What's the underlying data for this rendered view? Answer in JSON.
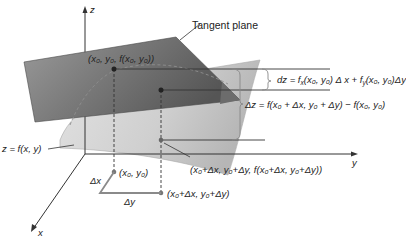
{
  "figure": {
    "colors": {
      "tangent_plane_dark": "#5e5e5e",
      "tangent_plane_light": "#9a9a9a",
      "surface_light": "#d4d4d4",
      "surface_mid": "#bdbdbd",
      "axis": "#333333",
      "point": "#444444",
      "domain_line": "#8a8a8a"
    }
  },
  "axes": {
    "z_label": "z",
    "y_label": "y",
    "x_label": "x"
  },
  "labels": {
    "tangent_plane": "Tangent plane",
    "surface": "z = f(x, y)",
    "point_top": "(x₀, y₀, f(x₀, y₀))",
    "point_surface": "(x₀+Δx, y₀+Δy, f(x₀+Δx, y₀+Δy))",
    "base_point": "(x₀, y₀)",
    "base_point_shifted": "(x₀+Δx,  y₀+Δy)",
    "delta_x": "Δx",
    "delta_y": "Δy",
    "dz_formula": "dz = fₓ(x₀, y₀) Δx  +  f_y(x₀, y₀)Δy",
    "dz_formula_lhs": "dz = f",
    "dz_formula_sub1": "x",
    "dz_formula_mid": "(x₀, y₀) Δ x  +  f",
    "dz_formula_sub2": "y",
    "dz_formula_rhs": "(x₀, y₀)Δy",
    "delta_z_formula": "Δz = f(x₀ + Δx,  y₀ + Δy) − f(x₀, y₀)"
  }
}
